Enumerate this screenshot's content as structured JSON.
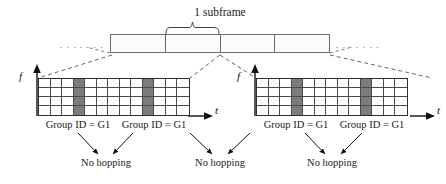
{
  "diagram": {
    "title_label": "1 subframe",
    "ellipsis_left": ". . . . . . .",
    "ellipsis_right": ". . . . . . .",
    "subframe_bar": {
      "segment_count": 4,
      "segments": [
        "",
        "",
        "",
        ""
      ],
      "highlighted_segment_index": 1
    },
    "axes": {
      "frequency_label": "f",
      "time_label": "t"
    },
    "grids": [
      {
        "id": "left-grid",
        "rows": 4,
        "columns": 13,
        "shaded_columns": [
          3,
          9
        ],
        "axis_f": "f",
        "axis_t": "t"
      },
      {
        "id": "right-grid",
        "rows": 4,
        "columns": 13,
        "shaded_columns": [
          3,
          9
        ],
        "axis_f": "f",
        "axis_t": "t"
      }
    ],
    "group_captions": [
      {
        "id": "left-group-1",
        "text": "Group ID = G1"
      },
      {
        "id": "left-group-2",
        "text": "Group ID = G1"
      },
      {
        "id": "right-group-1",
        "text": "Group ID = G1"
      },
      {
        "id": "right-group-2",
        "text": "Group ID = G1"
      }
    ],
    "hopping_captions": [
      {
        "id": "hop-1",
        "text": "No hopping"
      },
      {
        "id": "hop-2",
        "text": "No hopping"
      },
      {
        "id": "hop-3",
        "text": "No hopping"
      }
    ],
    "colors": {
      "shaded_cell": "#7c7c7c",
      "grid_line": "#4a4a4a",
      "grid_border": "#2d2d2d",
      "bar_border": "#6b6b6b",
      "bar_fill": "#fbfbfb",
      "dashed_line": "#555555",
      "text": "#1a1a1a",
      "background": "#ffffff"
    }
  }
}
